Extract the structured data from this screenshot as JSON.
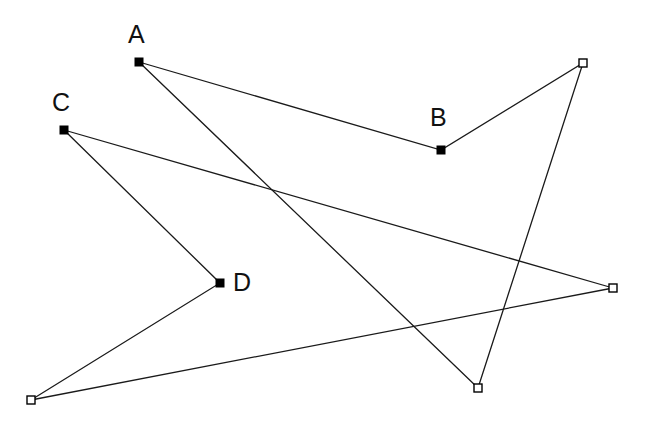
{
  "figure": {
    "width": 648,
    "height": 422,
    "background_color": "#ffffff",
    "line_color": "#1a1a1a",
    "line_width": 1.3,
    "marker_size": 8
  },
  "vertices": [
    {
      "id": "A",
      "label": "A",
      "x": 139,
      "y": 62,
      "marker": "filled-square",
      "label_x": 128,
      "label_y": 22,
      "labeled": true
    },
    {
      "id": "B",
      "label": "B",
      "x": 441,
      "y": 150,
      "marker": "filled-square",
      "label_x": 430,
      "label_y": 105,
      "labeled": true
    },
    {
      "id": "C",
      "label": "C",
      "x": 64,
      "y": 130,
      "marker": "filled-square",
      "label_x": 52,
      "label_y": 90,
      "labeled": true
    },
    {
      "id": "D",
      "label": "D",
      "x": 220,
      "y": 283,
      "marker": "filled-square",
      "label_x": 233,
      "label_y": 270,
      "labeled": true
    },
    {
      "id": "P1",
      "label": "",
      "x": 583,
      "y": 63,
      "marker": "open-square",
      "label_x": 0,
      "label_y": 0,
      "labeled": false
    },
    {
      "id": "P2",
      "label": "",
      "x": 478,
      "y": 388,
      "marker": "open-square",
      "label_x": 0,
      "label_y": 0,
      "labeled": false
    },
    {
      "id": "P3",
      "label": "",
      "x": 613,
      "y": 288,
      "marker": "open-square",
      "label_x": 0,
      "label_y": 0,
      "labeled": false
    },
    {
      "id": "P4",
      "label": "",
      "x": 31,
      "y": 400,
      "marker": "open-square",
      "label_x": 0,
      "label_y": 0,
      "labeled": false
    }
  ],
  "paths": [
    {
      "id": "path-filled",
      "name": "path-A-B-P1-P2-A",
      "marker_style": "filled-square",
      "points": [
        {
          "x": 478,
          "y": 388
        },
        {
          "x": 139,
          "y": 62
        },
        {
          "x": 441,
          "y": 150
        },
        {
          "x": 583,
          "y": 63
        },
        {
          "x": 478,
          "y": 388
        }
      ]
    },
    {
      "id": "path-open",
      "name": "path-C-D-P4-P3-C",
      "marker_style": "open-square",
      "points": [
        {
          "x": 613,
          "y": 288
        },
        {
          "x": 64,
          "y": 130
        },
        {
          "x": 220,
          "y": 283
        },
        {
          "x": 31,
          "y": 400
        },
        {
          "x": 613,
          "y": 288
        }
      ]
    }
  ]
}
